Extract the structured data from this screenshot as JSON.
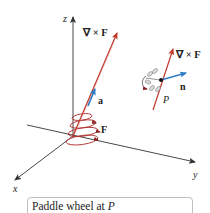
{
  "axes": {
    "x_label": "x",
    "y_label": "y",
    "z_label": "z"
  },
  "vectors": {
    "curl_label_main": "∇ × F",
    "a_label": "a",
    "F_label": "F",
    "curl_label_paddle": "∇ × F",
    "n_label": "n",
    "point_label": "P"
  },
  "caption": {
    "text": "Paddle wheel at ",
    "point": "P"
  },
  "colors": {
    "curl_vector": "#c0392b",
    "normal_vector": "#2e7bc4",
    "axis": "#333333",
    "spiral": "#b03030"
  }
}
